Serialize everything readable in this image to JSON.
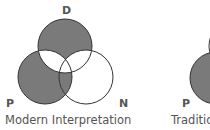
{
  "figures": [
    {
      "caption": "Modern Interpretation",
      "labels": {
        "top": "D",
        "left": "P",
        "right": "N"
      },
      "shaded_regions": [
        "D only",
        "P only",
        "D∩P",
        "P∩N"
      ],
      "unshaded_regions": [
        "N only",
        "D∩N",
        "D∩P∩N"
      ]
    },
    {
      "caption": "Traditio",
      "labels": {
        "left": "P"
      }
    }
  ],
  "colors": {
    "fill": "#7a7a7a",
    "stroke": "#333333",
    "background": "#ffffff",
    "text": "#555555"
  }
}
